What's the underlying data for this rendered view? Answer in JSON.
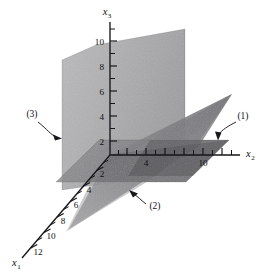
{
  "figure": {
    "kind": "3d-axes-planes"
  },
  "axes": {
    "x1": {
      "name": "x",
      "subscript": "1",
      "direction": "down-left",
      "tick_labels": [
        "2",
        "4",
        "6",
        "8",
        "10",
        "12"
      ],
      "tick_values": [
        2,
        4,
        6,
        8,
        10,
        12
      ],
      "minor_ticks_between": 1
    },
    "x2": {
      "name": "x",
      "subscript": "2",
      "direction": "right",
      "tick_labels": [
        "4",
        "10"
      ],
      "tick_values": [
        4,
        10
      ],
      "all_tick_values": [
        2,
        4,
        6,
        8,
        10,
        12
      ],
      "minor_ticks_between": 1
    },
    "x3": {
      "name": "x",
      "subscript": "3",
      "direction": "up",
      "tick_labels": [
        "2",
        "4",
        "6",
        "8",
        "10"
      ],
      "tick_values": [
        2,
        4,
        6,
        8,
        10
      ],
      "minor_ticks_between": 1
    }
  },
  "callouts": [
    {
      "id": "callout-1",
      "label": "(1)",
      "target": "horizontal-plane",
      "arrow": "down",
      "description": "horizontal plane at x3 = 2"
    },
    {
      "id": "callout-2",
      "label": "(2)",
      "target": "slanted-plane",
      "arrow": "up-left",
      "description": "slanted plane rising toward upper right"
    },
    {
      "id": "callout-3",
      "label": "(3)",
      "target": "vertical-plane",
      "arrow": "right",
      "description": "near-vertical plane facing the viewer"
    }
  ],
  "planes": [
    {
      "id": "plane-1",
      "label": "(1)",
      "shade": "#8d8d90",
      "opacity": 0.72,
      "orientation": "horizontal"
    },
    {
      "id": "plane-2",
      "label": "(2)",
      "shade": "#6e6e72",
      "opacity": 0.78,
      "orientation": "slanted"
    },
    {
      "id": "plane-3",
      "label": "(3)",
      "shade": "#a7a7a8",
      "opacity": 0.88,
      "orientation": "vertical"
    }
  ],
  "colors": {
    "background": "#ffffff",
    "axis": "#16161a",
    "text": "#111115",
    "plane_light": "#b0b0b1",
    "plane_mid": "#8d8d90",
    "plane_dark": "#5f5f63"
  }
}
